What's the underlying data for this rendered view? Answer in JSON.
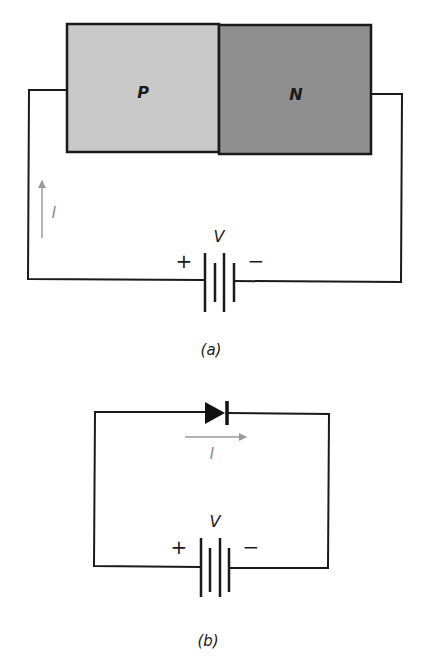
{
  "figure_a": {
    "caption": "(a)",
    "p_region_label": "P",
    "n_region_label": "N",
    "current_label": "I",
    "battery_label": "V",
    "battery_plus": "+",
    "battery_minus": "−",
    "colors": {
      "p_fill": "#c9c9c9",
      "n_fill": "#8f8f8f",
      "wire": "#1a1a1a",
      "current_arrow": "#9a9a9a"
    }
  },
  "figure_b": {
    "caption": "(b)",
    "current_label": "I",
    "battery_label": "V",
    "battery_plus": "+",
    "battery_minus": "−",
    "colors": {
      "diode": "#111111",
      "wire": "#1a1a1a",
      "current_arrow": "#9a9a9a"
    }
  }
}
